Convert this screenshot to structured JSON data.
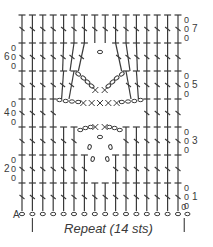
{
  "colors": {
    "ink": "#3a3a3a",
    "background": "#ffffff"
  },
  "repeat_label": "Repeat (14 sts)",
  "foundation_label": "A",
  "row_numbers": [
    {
      "row": 1,
      "label": "1",
      "side": "right"
    },
    {
      "row": 2,
      "label": "2",
      "side": "left"
    },
    {
      "row": 3,
      "label": "3",
      "side": "right"
    },
    {
      "row": 4,
      "label": "4",
      "side": "left"
    },
    {
      "row": 5,
      "label": "5",
      "side": "right"
    },
    {
      "row": 6,
      "label": "6",
      "side": "left"
    },
    {
      "row": 7,
      "label": "7",
      "side": "right"
    }
  ],
  "grid": {
    "columns": 16,
    "rows": 7,
    "x0": 22,
    "col_w": 10.4,
    "row_top_7": 15,
    "row_h": 28
  },
  "foundation": {
    "chains": 17,
    "y": 214
  },
  "legend_symbols": [
    "double-crochet",
    "chain",
    "single-crochet"
  ],
  "rows": [
    {
      "row": 1,
      "pattern": "16 dc"
    },
    {
      "row": 2,
      "pattern": "7 dc, ch 2, skip 2, 7 dc"
    },
    {
      "row": 3,
      "pattern": "6 dc, ch 4, 2 sc, ch 4, 6 dc"
    },
    {
      "row": 4,
      "pattern": "4 dc, ch 4, 5 sc, ch 4, 4 dc"
    },
    {
      "row": 5,
      "pattern": "6 dc, ch 4, 2 sc, ch 4, 6 dc"
    },
    {
      "row": 6,
      "pattern": "7 dc, ch 1, 7 dc"
    },
    {
      "row": 7,
      "pattern": "16 dc"
    }
  ]
}
